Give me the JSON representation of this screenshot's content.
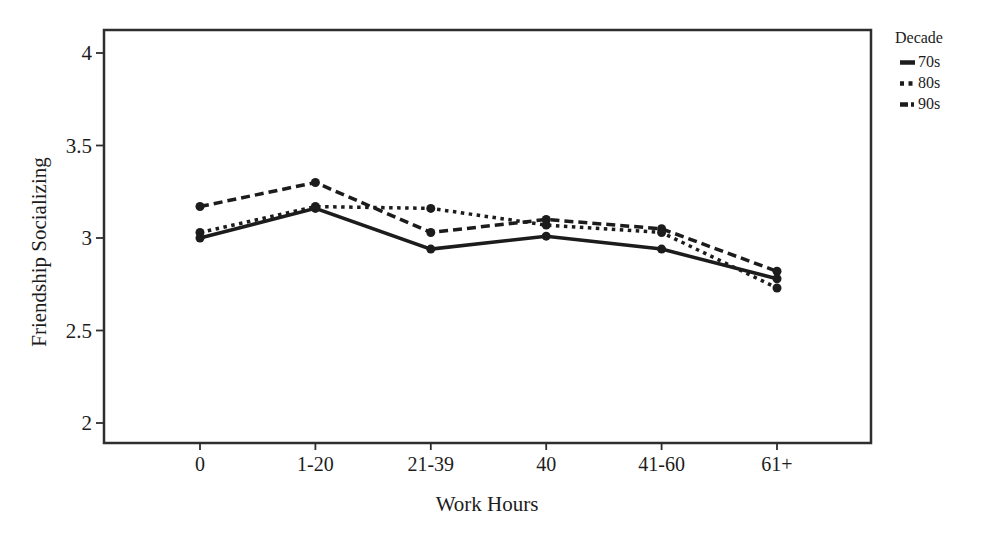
{
  "chart_data": {
    "type": "line",
    "title": "",
    "xlabel": "Work Hours",
    "ylabel": "Friendship Socializing",
    "legend_title": "Decade",
    "legend_position": "top-right-outside",
    "grid": false,
    "categories": [
      "0",
      "1-20",
      "21-39",
      "40",
      "41-60",
      "61+"
    ],
    "y_ticks": [
      "2",
      "2.5",
      "3",
      "3.5",
      "4"
    ],
    "y_tick_values": [
      2,
      2.5,
      3,
      3.5,
      4
    ],
    "ylim": [
      1.89,
      4.12
    ],
    "series": [
      {
        "name": "70s",
        "style": "solid",
        "values": [
          3.0,
          3.16,
          2.94,
          3.01,
          2.94,
          2.78
        ]
      },
      {
        "name": "80s",
        "style": "dotted",
        "values": [
          3.03,
          3.17,
          3.16,
          3.07,
          3.03,
          2.73
        ]
      },
      {
        "name": "90s",
        "style": "dashed",
        "values": [
          3.17,
          3.3,
          3.03,
          3.1,
          3.05,
          2.82
        ]
      }
    ],
    "line_color": "#1c1c1c",
    "axis_color": "#2e2e2e",
    "marker": "circle"
  }
}
